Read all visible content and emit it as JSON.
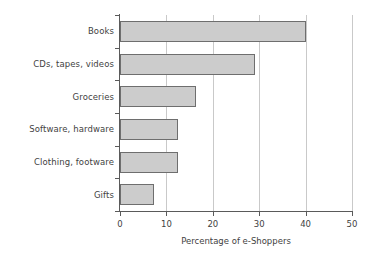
{
  "chart_data": {
    "type": "bar",
    "orientation": "horizontal",
    "title": "",
    "xlabel": "Percentage of e-Shoppers",
    "ylabel": "",
    "categories": [
      "Books",
      "CDs, tapes, videos",
      "Groceries",
      "Software, hardware",
      "Clothing, footware",
      "Gifts"
    ],
    "values": [
      40,
      29,
      16.3,
      12.5,
      12.5,
      7.3
    ],
    "xlim": [
      0,
      50
    ],
    "xticks": [
      0,
      10,
      20,
      30,
      40,
      50
    ],
    "xtick_labels": [
      "0",
      "10",
      "20",
      "30",
      "40",
      "50"
    ],
    "grid": "vertical",
    "legend": "none",
    "bar_fill_color": "#cccccc",
    "bar_border_color": "#6e6e6e",
    "axis_color": "#5a5a5a",
    "grid_color": "#c9c9c9",
    "background_color": "#ffffff"
  }
}
